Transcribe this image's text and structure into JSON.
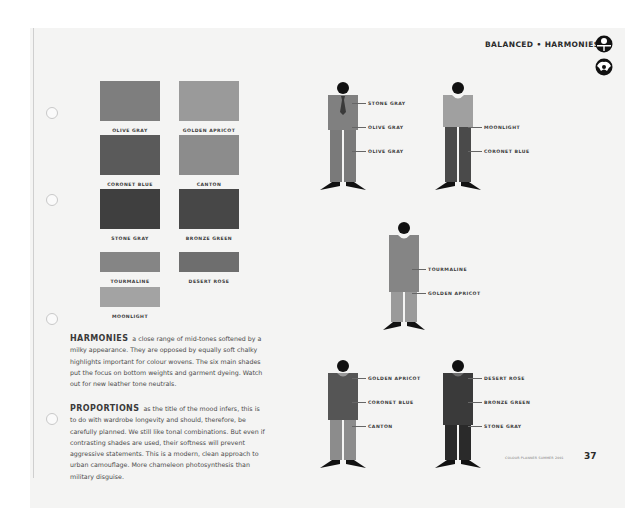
{
  "header": {
    "title": "BALANCED • HARMONIES"
  },
  "icons": [
    "balanced-symbol-icon",
    "harmonies-globe-icon"
  ],
  "palette": {
    "swatches": [
      {
        "name": "OLIVE GRAY",
        "color": "#7e7e7e"
      },
      {
        "name": "GOLDEN APRICOT",
        "color": "#9a9a9a"
      },
      {
        "name": "CORONET BLUE",
        "color": "#5a5a5a"
      },
      {
        "name": "CANTON",
        "color": "#8c8c8c"
      },
      {
        "name": "STONE GRAY",
        "color": "#3f3f3f"
      },
      {
        "name": "BRONZE GREEN",
        "color": "#474747"
      },
      {
        "name": "TOURMALINE",
        "color": "#858585"
      },
      {
        "name": "DESERT ROSE",
        "color": "#6e6e6e"
      },
      {
        "name": "MOONLIGHT",
        "color": "#a3a3a3"
      }
    ]
  },
  "text": {
    "harmonies_heading": "HARMONIES",
    "harmonies_body": "a close range of mid-tones softened by a milky appearance. They are opposed by equally soft chalky highlights important for colour wovens. The six main shades put the focus on bottom weights and garment dyeing. Watch out for new leather tone neutrals.",
    "proportions_heading": "PROPORTIONS",
    "proportions_body": "as the title of the mood infers, this is to do with wardrobe longevity and should, therefore, be carefully planned. We still like tonal combinations. But even if contrasting shades are used, their softness will prevent aggressive statements. This is a modern, clean approach to urban camouflage. More chameleon photosynthesis than military disguise."
  },
  "figures": [
    {
      "id": "figure-1",
      "labels": [
        "STONE GRAY",
        "OLIVE GRAY",
        "OLIVE GRAY"
      ]
    },
    {
      "id": "figure-2",
      "labels": [
        "MOONLIGHT",
        "CORONET BLUE"
      ]
    },
    {
      "id": "figure-3",
      "labels": [
        "TOURMALINE",
        "GOLDEN APRICOT"
      ]
    },
    {
      "id": "figure-4",
      "labels": [
        "GOLDEN APRICOT",
        "CORONET BLUE",
        "CANTON"
      ]
    },
    {
      "id": "figure-5",
      "labels": [
        "DESERT ROSE",
        "BRONZE GREEN",
        "STONE GRAY"
      ]
    }
  ],
  "footer": {
    "note": "COLOUR PLANNER SUMMER 2001",
    "page_number": "37"
  }
}
